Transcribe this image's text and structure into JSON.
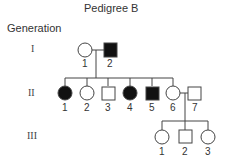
{
  "title": "Pedigree B",
  "generation_header": "Generation",
  "generations": [
    {
      "roman": "I",
      "individuals": [
        {
          "label": "1",
          "sex": "female",
          "affected": false
        },
        {
          "label": "2",
          "sex": "male",
          "affected": true
        }
      ]
    },
    {
      "roman": "II",
      "individuals": [
        {
          "label": "1",
          "sex": "female",
          "affected": true
        },
        {
          "label": "2",
          "sex": "female",
          "affected": false
        },
        {
          "label": "3",
          "sex": "male",
          "affected": false
        },
        {
          "label": "4",
          "sex": "female",
          "affected": true
        },
        {
          "label": "5",
          "sex": "male",
          "affected": true
        },
        {
          "label": "6",
          "sex": "female",
          "affected": false
        },
        {
          "label": "7",
          "sex": "male",
          "affected": false
        }
      ]
    },
    {
      "roman": "III",
      "individuals": [
        {
          "label": "1",
          "sex": "female",
          "affected": false
        },
        {
          "label": "2",
          "sex": "male",
          "affected": false
        },
        {
          "label": "3",
          "sex": "female",
          "affected": false
        }
      ]
    }
  ],
  "colors": {
    "line": "#444444",
    "affected": "#111111",
    "unaffected": "#ffffff"
  }
}
